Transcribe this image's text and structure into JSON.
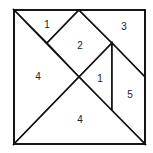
{
  "diagram": {
    "type": "tangram-square",
    "outline": {
      "x1": 14,
      "y1": 10,
      "x2": 145,
      "y2": 144
    },
    "stroke_color": "#111111",
    "fill_color": "#ffffff",
    "pieces": [
      {
        "id": "top-left-small-triangle",
        "label": "1",
        "points": "14,10 79,10 47,43",
        "label_pos": [
          47,
          24
        ]
      },
      {
        "id": "square",
        "label": "2",
        "points": "79,10 112,43 79,77 47,43",
        "label_pos": [
          80,
          45
        ]
      },
      {
        "id": "top-right-parallelogram",
        "label": "3",
        "points": "79,10 145,10 145,77 112,43",
        "label_pos": [
          124,
          26
        ]
      },
      {
        "id": "left-large-triangle",
        "label": "4",
        "points": "14,10 79,77 14,144",
        "label_pos": [
          38,
          76
        ]
      },
      {
        "id": "middle-small-triangle",
        "label": "1",
        "points": "112,43 112,111 79,77",
        "label_pos": [
          100,
          78
        ]
      },
      {
        "id": "right-medium-triangle",
        "label": "5",
        "points": "112,43 145,77 145,144 112,111",
        "label_pos": [
          130,
          94
        ]
      },
      {
        "id": "bottom-large-triangle",
        "label": "4",
        "points": "14,144 79,77 145,144",
        "label_pos": [
          80,
          119
        ]
      }
    ]
  }
}
